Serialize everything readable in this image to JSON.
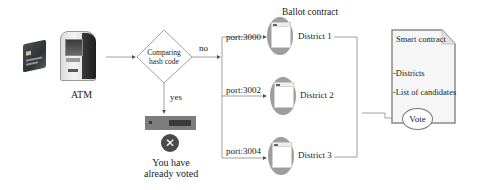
{
  "diagram": {
    "atm": {
      "label": "ATM"
    },
    "decision": {
      "line1": "Comparing",
      "line2": "hash code"
    },
    "branches": {
      "no": "no",
      "yes": "yes"
    },
    "rejection": {
      "line1": "You have",
      "line2": "already voted",
      "icon": "x-circle-icon"
    },
    "ballot_contract": {
      "title": "Ballot contract",
      "districts": [
        {
          "port": "port:3000",
          "label": "District 1"
        },
        {
          "port": "port:3002",
          "label": "District 2"
        },
        {
          "port": "port:3004",
          "label": "District 3"
        }
      ]
    },
    "smart_contract": {
      "title": "Smart contract",
      "items": [
        "-Districts",
        "-List of candidates"
      ],
      "action": "Vote"
    }
  }
}
